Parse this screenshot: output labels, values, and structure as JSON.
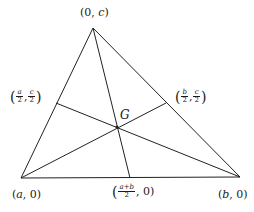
{
  "diagram": {
    "vertices": {
      "apex": {
        "label": "(0, c)",
        "x": 93,
        "y": 28
      },
      "left": {
        "label": "(a, 0)",
        "x": 21,
        "y": 178
      },
      "right": {
        "label": "(b, 0)",
        "x": 240,
        "y": 177
      }
    },
    "midpoints": {
      "left_side": {
        "label": "(a/2, c/2)",
        "num1": "a",
        "den1": "2",
        "num2": "c",
        "den2": "2",
        "x": 56,
        "y": 103
      },
      "right_side": {
        "label": "(b/2, c/2)",
        "num1": "b",
        "den1": "2",
        "num2": "c",
        "den2": "2",
        "x": 166,
        "y": 103
      },
      "base": {
        "label": "((a+b)/2, 0)",
        "num": "a+b",
        "den": "2",
        "x": 130,
        "y": 178
      }
    },
    "centroid": {
      "label": "G",
      "x": 117,
      "y": 127
    },
    "line_color": "#222222",
    "labels": {
      "apex_open": "(0, ",
      "apex_var": "c",
      "apex_close": ")",
      "left_open": "(",
      "left_var": "a",
      "left_close": ", 0)",
      "right_open": "(",
      "right_var": "b",
      "right_close": ", 0)",
      "comma": ",",
      "open_paren": "(",
      "close_paren": ")",
      "base_tail": ", 0)",
      "g": "G"
    }
  }
}
